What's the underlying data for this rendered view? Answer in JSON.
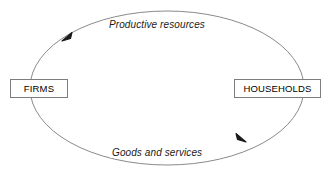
{
  "diagram": {
    "canvas": {
      "width": 331,
      "height": 175,
      "background": "#ffffff"
    },
    "nodes": [
      {
        "id": "firms",
        "label": "FIRMS"
      },
      {
        "id": "households",
        "label": "HOUSEHOLDS"
      }
    ],
    "flows": [
      {
        "id": "top-flow",
        "label": "Productive resources",
        "from": "households",
        "to": "firms",
        "direction": "right-to-left"
      },
      {
        "id": "bottom-flow",
        "label": "Goods and services",
        "from": "firms",
        "to": "households",
        "direction": "left-to-right"
      }
    ],
    "style": {
      "loop_stroke": "#8a8a8a",
      "arrow_fill": "#1a1a1a",
      "box_border": "#7d7d7d",
      "text_color": "#000000"
    },
    "geometry": {
      "ellipse": {
        "cx": 167,
        "cy": 88,
        "rx": 137,
        "ry": 77
      },
      "arrow_top_tip": {
        "x": 62,
        "y": 40
      },
      "arrow_bottom_tip": {
        "x": 246,
        "y": 141
      }
    }
  }
}
